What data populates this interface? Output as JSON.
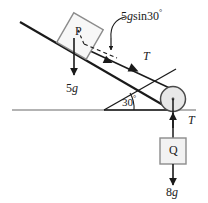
{
  "figure": {
    "type": "physics-free-body-diagram",
    "background_color": "#ffffff",
    "line_color": "#1a1a1a",
    "ground_color": "#9a9a9a",
    "block_fill": "#f2f2f2",
    "block_stroke": "#8c8c8c",
    "pulley_fill": "#e8e8e8",
    "pulley_stroke": "#6e6e6e"
  },
  "labels": {
    "block_p": "P",
    "block_q": "Q",
    "weight_p": "5g",
    "weight_p_value": "5",
    "weight_p_unit": "g",
    "weight_q": "8g",
    "weight_q_value": "8",
    "weight_q_unit": "g",
    "component": "5g sin30°",
    "component_value": "5",
    "component_g": "g",
    "component_fn": "sin",
    "component_angle": "30",
    "component_degree": "°",
    "tension_incline": "T",
    "tension_vertical": "T",
    "angle": "30°",
    "angle_value": "30",
    "angle_degree": "°"
  },
  "geometry": {
    "incline_angle_deg": 30,
    "pulley": {
      "cx": 173,
      "cy": 99,
      "r": 12.5
    },
    "angle_vertex": {
      "x": 104,
      "y": 110
    },
    "ground_line": {
      "x1": 12,
      "y1": 110,
      "x2": 196,
      "y2": 110
    },
    "incline_top": {
      "x": 20,
      "y": 22
    },
    "block_p": {
      "cx": 80,
      "cy": 36,
      "size": 34,
      "rotation_deg": -27
    },
    "block_q": {
      "cx": 173,
      "cy": 151,
      "size": 26
    }
  }
}
